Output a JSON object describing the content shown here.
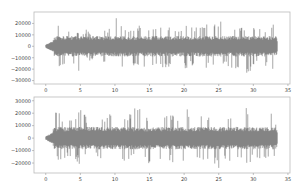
{
  "chart_data": [
    {
      "type": "line",
      "title": "",
      "xlabel": "",
      "ylabel": "",
      "description": "Audio waveform, channel 1 (amplitude vs time in seconds)",
      "xlim": [
        -1.7,
        35.3
      ],
      "ylim": [
        -33000,
        30000
      ],
      "xticks": [
        0,
        5,
        10,
        15,
        20,
        25,
        30,
        35
      ],
      "yticks": [
        20000,
        10000,
        0,
        -10000,
        -20000,
        -30000
      ],
      "ytick_labels": [
        "20000",
        "10000",
        "0",
        "−10000",
        "−20000",
        "−30000"
      ],
      "grid": false,
      "color": "#555555",
      "signal_range_seconds": [
        0,
        33.5
      ],
      "typical_amplitude": 9000,
      "peak_positive": 26000,
      "peak_negative": -31000,
      "envelope_samples": {
        "t": [
          0,
          0.5,
          1.0,
          1.5,
          2.0,
          2.5,
          3,
          4,
          5,
          6,
          7,
          8,
          9,
          10,
          11,
          12,
          13,
          14,
          15,
          16,
          17,
          18,
          19,
          20,
          21,
          22,
          23,
          24,
          25,
          26,
          27,
          28,
          29,
          30,
          31,
          32,
          33,
          33.5
        ],
        "max": [
          1500,
          3000,
          4000,
          22000,
          24000,
          20000,
          18000,
          16000,
          14000,
          15000,
          12000,
          16000,
          15000,
          26000,
          20000,
          18000,
          17000,
          22000,
          18000,
          16000,
          20000,
          19000,
          15000,
          21000,
          18000,
          17000,
          22000,
          18000,
          25000,
          19000,
          18000,
          20000,
          17000,
          19000,
          16000,
          18000,
          20000,
          3000
        ],
        "min": [
          -1500,
          -3000,
          -4000,
          -20000,
          -22000,
          -18000,
          -16000,
          -15000,
          -25000,
          -14000,
          -13000,
          -17000,
          -16000,
          -31000,
          -20000,
          -18000,
          -17000,
          -21000,
          -22000,
          -16000,
          -19000,
          -18000,
          -24000,
          -20000,
          -18000,
          -17000,
          -21000,
          -18000,
          -24000,
          -18000,
          -20000,
          -19000,
          -26000,
          -18000,
          -17000,
          -19000,
          -21000,
          -3000
        ]
      }
    },
    {
      "type": "line",
      "title": "",
      "xlabel": "",
      "ylabel": "",
      "description": "Audio waveform, channel 2 (amplitude vs time in seconds)",
      "xlim": [
        -1.7,
        35.3
      ],
      "ylim": [
        -28000,
        33000
      ],
      "xticks": [
        0,
        5,
        10,
        15,
        20,
        25,
        30,
        35
      ],
      "yticks": [
        30000,
        20000,
        10000,
        0,
        -10000,
        -20000
      ],
      "ytick_labels": [
        "30000",
        "20000",
        "10000",
        "0",
        "−10000",
        "−20000"
      ],
      "grid": false,
      "color": "#555555",
      "signal_range_seconds": [
        0,
        33.5
      ],
      "typical_amplitude": 9000,
      "peak_positive": 30000,
      "peak_negative": -27000,
      "envelope_samples": {
        "t": [
          0,
          0.5,
          1.0,
          1.5,
          2.0,
          2.5,
          3,
          4,
          5,
          6,
          7,
          8,
          9,
          10,
          11,
          12,
          13,
          14,
          15,
          16,
          17,
          18,
          19,
          20,
          21,
          22,
          23,
          24,
          25,
          26,
          27,
          28,
          29,
          30,
          31,
          32,
          33,
          33.5
        ],
        "max": [
          1500,
          3000,
          4000,
          25000,
          22000,
          18000,
          16000,
          15000,
          26000,
          15000,
          12000,
          16000,
          17000,
          30000,
          20000,
          18000,
          29000,
          22000,
          18000,
          16000,
          20000,
          19000,
          18000,
          28000,
          18000,
          17000,
          22000,
          18000,
          31000,
          19000,
          18000,
          20000,
          28000,
          19000,
          16000,
          18000,
          22000,
          3000
        ],
        "min": [
          -1500,
          -3000,
          -4000,
          -20000,
          -21000,
          -17000,
          -15000,
          -15000,
          -22000,
          -14000,
          -13000,
          -17000,
          -16000,
          -27000,
          -20000,
          -18000,
          -17000,
          -21000,
          -22000,
          -16000,
          -19000,
          -18000,
          -24000,
          -20000,
          -18000,
          -17000,
          -21000,
          -18000,
          -24000,
          -18000,
          -20000,
          -19000,
          -21000,
          -18000,
          -17000,
          -19000,
          -21000,
          -3000
        ]
      }
    }
  ],
  "layout": {
    "axes": [
      {
        "left": 34,
        "top": 12,
        "right": 290,
        "bottom": 84
      },
      {
        "left": 34,
        "top": 97,
        "right": 290,
        "bottom": 173
      }
    ]
  }
}
